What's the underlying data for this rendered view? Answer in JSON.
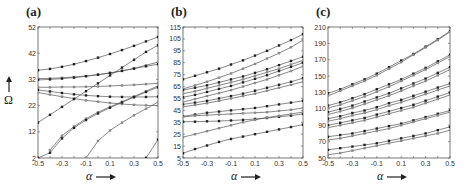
{
  "chart_data": [
    {
      "type": "line",
      "panel": "(a)",
      "xlabel": "α",
      "ylabel": "Ω",
      "x": [
        -0.5,
        -0.4,
        -0.3,
        -0.2,
        -0.1,
        0.0,
        0.1,
        0.2,
        0.3,
        0.4,
        0.5
      ],
      "xticks": [
        "-0.5",
        "-0.3",
        "-0.1",
        "0.1",
        "0.3",
        "0.5"
      ],
      "yticks": [
        "2",
        "12",
        "22",
        "32",
        "42",
        "52"
      ],
      "ylim": [
        2,
        52
      ],
      "series": [
        {
          "name": "s1",
          "values": [
            35.5,
            36,
            36.8,
            37.8,
            39,
            40.3,
            41.7,
            43.2,
            44.8,
            46.5,
            48.2
          ]
        },
        {
          "name": "s2",
          "values": [
            32.3,
            32.4,
            32.6,
            32.9,
            33.3,
            33.8,
            34.4,
            35.2,
            36.2,
            37.4,
            38.6
          ]
        },
        {
          "name": "s3",
          "values": [
            31.8,
            32,
            32.3,
            32.7,
            33.2,
            33.8,
            34.5,
            35.3,
            36.1,
            37,
            37.8
          ]
        },
        {
          "name": "s4",
          "values": [
            29,
            29,
            29.1,
            29.1,
            29.2,
            29.3,
            29.5,
            29.7,
            29.9,
            30.2,
            30.5
          ]
        },
        {
          "name": "s5",
          "values": [
            28,
            27.4,
            26.8,
            26.3,
            25.9,
            25.6,
            25.4,
            25.3,
            25.3,
            25.3,
            25.4
          ]
        },
        {
          "name": "s6",
          "values": [
            27,
            26.2,
            25.4,
            24.7,
            24,
            23.5,
            23,
            22.6,
            22.3,
            22.1,
            22
          ]
        },
        {
          "name": "s7",
          "values": [
            15.5,
            18.5,
            21.5,
            24.5,
            27.5,
            30.5,
            33.5,
            36.5,
            39.5,
            42.5,
            45
          ]
        },
        {
          "name": "s8",
          "values": [
            null,
            5,
            10.5,
            14,
            17,
            19.5,
            21.5,
            23.5,
            25.5,
            27.5,
            29.5
          ]
        },
        {
          "name": "s9",
          "values": [
            2,
            4,
            9.5,
            13.5,
            16.5,
            19,
            21.2,
            23.2,
            25.2,
            27.2,
            29
          ]
        },
        {
          "name": "s10",
          "values": [
            null,
            null,
            null,
            null,
            2,
            8.5,
            12.5,
            15.5,
            18.3,
            20.8,
            23.3
          ]
        },
        {
          "name": "s11",
          "values": [
            null,
            null,
            null,
            null,
            null,
            null,
            null,
            null,
            null,
            2,
            9
          ]
        }
      ]
    },
    {
      "type": "line",
      "panel": "(b)",
      "xlabel": "α",
      "x": [
        -0.5,
        -0.4,
        -0.3,
        -0.2,
        -0.1,
        0.0,
        0.1,
        0.2,
        0.3,
        0.4,
        0.5
      ],
      "xticks": [
        "-0.5",
        "-0.3",
        "-0.1",
        "0.1",
        "0.3",
        "0.5"
      ],
      "yticks": [
        "5",
        "15",
        "25",
        "35",
        "45",
        "55",
        "65",
        "75",
        "85",
        "95",
        "105",
        "115"
      ],
      "ylim": [
        5,
        115
      ],
      "series": [
        {
          "name": "s1",
          "values": [
            71,
            74,
            77,
            80,
            83.5,
            87,
            91,
            95,
            99.5,
            104,
            109
          ]
        },
        {
          "name": "s2",
          "values": [
            63,
            66,
            69,
            72.5,
            76,
            80,
            84,
            88.5,
            93,
            98,
            104
          ]
        },
        {
          "name": "s3",
          "values": [
            62,
            64,
            66,
            68.5,
            71,
            73.5,
            76.5,
            79.5,
            83,
            86.5,
            90
          ]
        },
        {
          "name": "s4",
          "values": [
            59,
            61,
            63.5,
            66,
            68.5,
            71,
            74,
            77,
            80,
            83.5,
            87
          ]
        },
        {
          "name": "s5",
          "values": [
            56,
            58,
            60.5,
            63,
            65.5,
            68.5,
            71.5,
            74.5,
            78,
            81.5,
            85
          ]
        },
        {
          "name": "s6",
          "values": [
            52,
            54.5,
            57,
            59.5,
            62,
            65,
            68,
            71,
            74.5,
            78,
            82
          ]
        },
        {
          "name": "s7",
          "values": [
            50,
            51.5,
            53,
            55,
            57,
            59,
            61.5,
            64,
            66.5,
            69,
            72
          ]
        },
        {
          "name": "s8",
          "values": [
            48,
            49.5,
            51,
            53,
            55,
            57,
            59,
            61.5,
            64,
            66.5,
            69
          ]
        },
        {
          "name": "s9",
          "values": [
            40,
            41.5,
            43,
            44,
            45,
            46,
            47,
            48.5,
            50,
            51.5,
            53
          ]
        },
        {
          "name": "s10",
          "values": [
            39.5,
            40.5,
            41,
            41.5,
            42,
            42.5,
            43,
            43.5,
            44.5,
            45.5,
            47
          ]
        },
        {
          "name": "s11",
          "values": [
            35.5,
            35.5,
            35.8,
            36,
            36.5,
            37,
            37.8,
            38.6,
            39.6,
            40.6,
            42
          ]
        },
        {
          "name": "s12",
          "values": [
            22.5,
            25,
            27.5,
            30,
            32.5,
            35,
            37,
            39,
            40.5,
            42,
            43.5
          ]
        },
        {
          "name": "s13",
          "values": [
            9,
            12.5,
            15.5,
            18.5,
            21,
            23,
            25,
            27,
            29,
            31,
            33
          ]
        }
      ]
    },
    {
      "type": "line",
      "panel": "(c)",
      "xlabel": "α",
      "x": [
        -0.5,
        -0.4,
        -0.3,
        -0.2,
        -0.1,
        0.0,
        0.1,
        0.2,
        0.3,
        0.4,
        0.5
      ],
      "xticks": [
        "-0.5",
        "-0.3",
        "-0.1",
        "0.1",
        "0.3",
        "0.5"
      ],
      "yticks": [
        "50",
        "70",
        "90",
        "110",
        "130",
        "150",
        "170",
        "190",
        "210"
      ],
      "ylim": [
        50,
        210
      ],
      "series": [
        {
          "name": "s1",
          "values": [
            129,
            134,
            140,
            146,
            153,
            161,
            169,
            177,
            186,
            195,
            205
          ]
        },
        {
          "name": "s2",
          "values": [
            126,
            132,
            138,
            144,
            151,
            159,
            167,
            176,
            185,
            194,
            204
          ]
        },
        {
          "name": "s3",
          "values": [
            114,
            118,
            123,
            128,
            134,
            140,
            146,
            153,
            160,
            168,
            176
          ]
        },
        {
          "name": "s4",
          "values": [
            111,
            115,
            120,
            125,
            131,
            137,
            144,
            151,
            158,
            166,
            174
          ]
        },
        {
          "name": "s5",
          "values": [
            106,
            110,
            114,
            119,
            124,
            129,
            135,
            141,
            147,
            154,
            161
          ]
        },
        {
          "name": "s6",
          "values": [
            103,
            107,
            111,
            116,
            121,
            126,
            132,
            138,
            144,
            151,
            158
          ]
        },
        {
          "name": "s7",
          "values": [
            98,
            101,
            105,
            108,
            112,
            117,
            121,
            126,
            131,
            136,
            141
          ]
        },
        {
          "name": "s8",
          "values": [
            95,
            98,
            102,
            105,
            109,
            114,
            118,
            123,
            128,
            133,
            138
          ]
        },
        {
          "name": "s9",
          "values": [
            90,
            93,
            96,
            99,
            103,
            107,
            111,
            115,
            120,
            125,
            130
          ]
        },
        {
          "name": "s10",
          "values": [
            87,
            90,
            93,
            96,
            100,
            104,
            108,
            112,
            117,
            122,
            127
          ]
        },
        {
          "name": "s11",
          "values": [
            76,
            78,
            80,
            83,
            86,
            89,
            92,
            96,
            100,
            104,
            108
          ]
        },
        {
          "name": "s12",
          "values": [
            72,
            74,
            77,
            80,
            83,
            86,
            90,
            94,
            98,
            102,
            106
          ]
        },
        {
          "name": "s13",
          "values": [
            60,
            62,
            64,
            66,
            68,
            71,
            74,
            77,
            80,
            84,
            88
          ]
        },
        {
          "name": "s14",
          "values": [
            54,
            56,
            59,
            62,
            65,
            68,
            71,
            74,
            77,
            80,
            84
          ]
        }
      ]
    }
  ],
  "panels": [
    {
      "label": "(a)",
      "box": [
        38,
        27,
        158,
        158
      ]
    },
    {
      "label": "(b)",
      "box": [
        183,
        27,
        303,
        158
      ]
    },
    {
      "label": "(c)",
      "box": [
        328,
        27,
        450,
        158
      ]
    }
  ],
  "labels": {
    "alpha": "α",
    "omega": "Ω"
  }
}
